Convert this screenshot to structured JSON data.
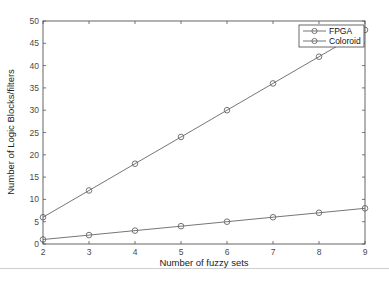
{
  "chart_data": {
    "type": "line",
    "title": "",
    "xlabel": "Number of fuzzy sets",
    "ylabel": "Number of Logic Blocks/filters",
    "x": [
      2,
      3,
      4,
      5,
      6,
      7,
      8,
      9
    ],
    "series": [
      {
        "name": "FPGA",
        "values": [
          6,
          12,
          18,
          24,
          30,
          36,
          42,
          48
        ],
        "marker": "circle",
        "color": "#666666"
      },
      {
        "name": "Coloroid",
        "values": [
          1,
          2,
          3,
          4,
          5,
          6,
          7,
          8
        ],
        "marker": "circle",
        "color": "#666666"
      }
    ],
    "xlim": [
      2,
      9
    ],
    "ylim": [
      0,
      50
    ],
    "xticks": [
      2,
      3,
      4,
      5,
      6,
      7,
      8,
      9
    ],
    "yticks": [
      0,
      5,
      10,
      15,
      20,
      25,
      30,
      35,
      40,
      45,
      50
    ],
    "grid": false,
    "legend_position": "top-right"
  },
  "legend": {
    "items": [
      {
        "label": "FPGA"
      },
      {
        "label": "Coloroid"
      }
    ]
  },
  "colors": {
    "axis": "#555555",
    "line": "#666666",
    "marker": "#666666",
    "divider": "#cfcfcf"
  }
}
